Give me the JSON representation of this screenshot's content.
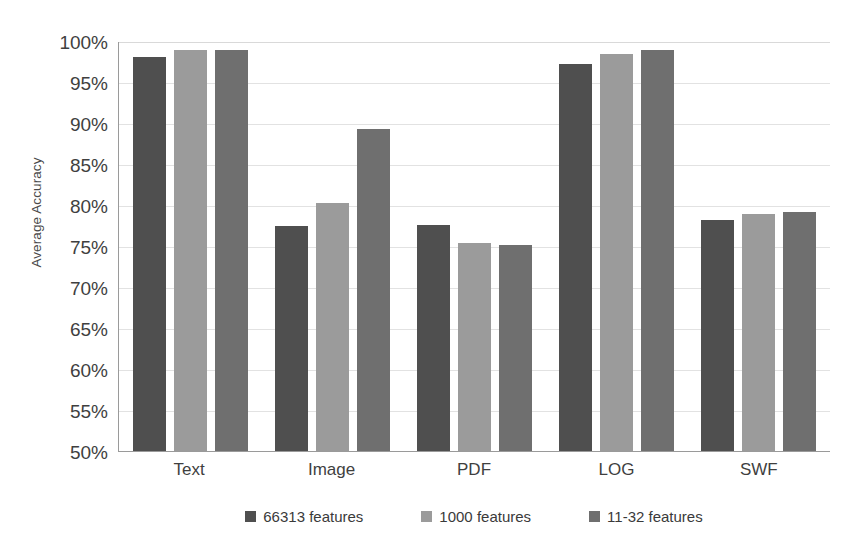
{
  "chart_data": {
    "type": "bar",
    "title": "",
    "xlabel": "",
    "ylabel": "Average Accuracy",
    "ylim": [
      50,
      100
    ],
    "ytick_labels": [
      "100%",
      "95%",
      "90%",
      "85%",
      "80%",
      "75%",
      "70%",
      "65%",
      "60%",
      "55%",
      "50%"
    ],
    "ytick_values": [
      100,
      95,
      90,
      85,
      80,
      75,
      70,
      65,
      60,
      55,
      50
    ],
    "grid": true,
    "legend_position": "bottom",
    "categories": [
      "Text",
      "Image",
      "PDF",
      "LOG",
      "SWF"
    ],
    "series": [
      {
        "name": "66313 features",
        "color": "#4f4f4f",
        "values": [
          98.2,
          77.5,
          77.6,
          97.3,
          78.3
        ]
      },
      {
        "name": "1000 features",
        "color": "#9b9b9b",
        "values": [
          99.0,
          80.3,
          75.4,
          98.5,
          79.0
        ]
      },
      {
        "name": "11-32 features",
        "color": "#6f6f6f",
        "values": [
          99.0,
          89.4,
          75.2,
          99.0,
          79.2
        ]
      }
    ]
  },
  "axis": {
    "y_title": "Average Accuracy"
  },
  "colors": {
    "series_1": "#4f4f4f",
    "series_2": "#9b9b9b",
    "series_3": "#6f6f6f",
    "gridline": "#e2e2e2",
    "axis_line": "#9a9a9a",
    "text": "#3f3f3f",
    "background": "#ffffff"
  }
}
